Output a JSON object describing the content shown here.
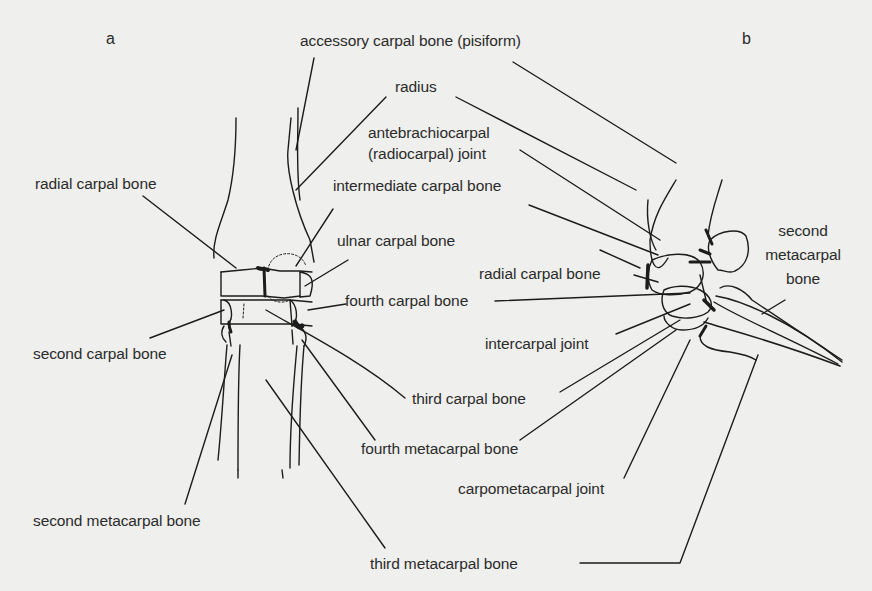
{
  "figure": {
    "panels": [
      {
        "id": "a",
        "letter": "a"
      },
      {
        "id": "b",
        "letter": "b"
      }
    ],
    "labels": {
      "accessory_carpal": "accessory carpal bone (pisiform)",
      "radius": "radius",
      "antebrachiocarpal_1": "antebrachiocarpal",
      "antebrachiocarpal_2": "(radiocarpal) joint",
      "radial_carpal_a": "radial carpal bone",
      "intermediate_carpal": "intermediate carpal bone",
      "ulnar_carpal": "ulnar carpal bone",
      "radial_carpal_b": "radial carpal bone",
      "fourth_carpal": "fourth carpal bone",
      "second_carpal": "second carpal bone",
      "intercarpal_joint": "intercarpal joint",
      "third_carpal": "third carpal bone",
      "fourth_metacarpal": "fourth metacarpal bone",
      "carpometacarpal_joint": "carpometacarpal joint",
      "second_metacarpal_a": "second metacarpal bone",
      "third_metacarpal": "third metacarpal bone",
      "second_metacarpal_b_1": "second",
      "second_metacarpal_b_2": "metacarpal",
      "second_metacarpal_b_3": "bone"
    },
    "colors": {
      "background": "#efefed",
      "ink": "#1c1c1c",
      "text": "#2b2b2b"
    }
  }
}
